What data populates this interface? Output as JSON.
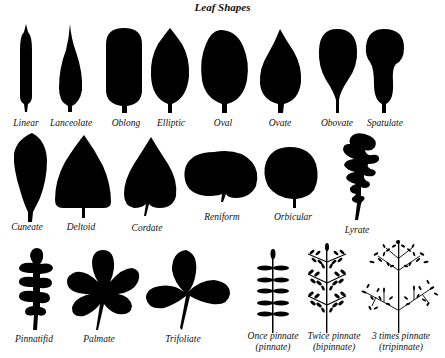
{
  "title": "Leaf Shapes",
  "colors": {
    "background": "#ffffff",
    "leaf": "#000000",
    "text": "#111111"
  },
  "rows": [
    {
      "shapes": [
        {
          "name": "Linear",
          "x": 26,
          "label_y": 118
        },
        {
          "name": "Lanceolate",
          "x": 70,
          "label_y": 118
        },
        {
          "name": "Oblong",
          "x": 125,
          "label_y": 118
        },
        {
          "name": "Elliptic",
          "x": 170,
          "label_y": 118
        },
        {
          "name": "Oval",
          "x": 223,
          "label_y": 118
        },
        {
          "name": "Ovate",
          "x": 280,
          "label_y": 118
        },
        {
          "name": "Obovate",
          "x": 337,
          "label_y": 118
        },
        {
          "name": "Spatulate",
          "x": 384,
          "label_y": 118
        }
      ]
    },
    {
      "shapes": [
        {
          "name": "Cuneate",
          "x": 30,
          "label_y": 222
        },
        {
          "name": "Deltoid",
          "x": 82,
          "label_y": 222
        },
        {
          "name": "Cordate",
          "x": 149,
          "label_y": 223
        },
        {
          "name": "Reniform",
          "x": 223,
          "label_y": 212
        },
        {
          "name": "Orbicular",
          "x": 293,
          "label_y": 212
        },
        {
          "name": "Lyrate",
          "x": 358,
          "label_y": 225
        }
      ]
    },
    {
      "shapes": [
        {
          "name": "Pinnatifid",
          "x": 34,
          "label_y": 334
        },
        {
          "name": "Palmate",
          "x": 102,
          "label_y": 334
        },
        {
          "name": "Trifoliate",
          "x": 183,
          "label_y": 334
        },
        {
          "name": "Once pinnate",
          "subname": "(pinnate)",
          "x": 273,
          "label_y": 331
        },
        {
          "name": "Twice pinnate",
          "subname": "(bipinnate)",
          "x": 334,
          "label_y": 331
        },
        {
          "name": "3 times pinnate",
          "subname": "(tripinnate)",
          "x": 400,
          "label_y": 331
        }
      ]
    }
  ]
}
